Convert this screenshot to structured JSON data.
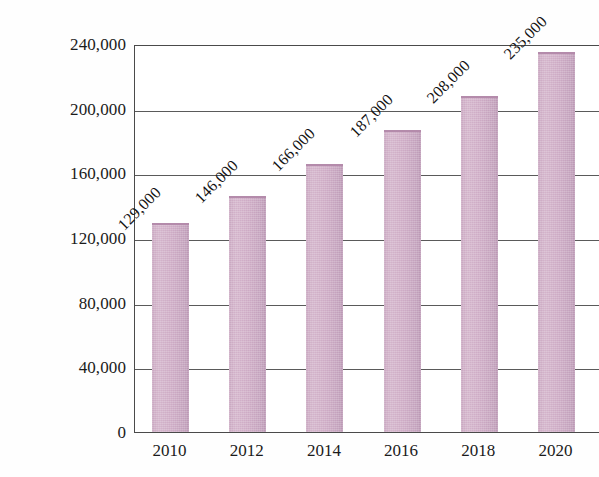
{
  "chart_data": {
    "type": "bar",
    "title": "",
    "xlabel": "",
    "ylabel": "Population",
    "categories": [
      "2010",
      "2012",
      "2014",
      "2016",
      "2018",
      "2020"
    ],
    "values": [
      129000,
      146000,
      166000,
      187000,
      208000,
      235000
    ],
    "data_labels": [
      "129,000",
      "146,000",
      "166,000",
      "187,000",
      "208,000",
      "235,000"
    ],
    "ylim": [
      0,
      240000
    ],
    "ytick_values": [
      0,
      40000,
      80000,
      120000,
      160000,
      200000,
      240000
    ],
    "ytick_labels": [
      "0",
      "40,000",
      "80,000",
      "120,000",
      "160,000",
      "200,000",
      "240,000"
    ],
    "grid": true,
    "legend": null,
    "series_color": "#cdaac4",
    "axis_color": "#4a4a4a",
    "gridline_color": "#5a5a5a",
    "text_color": "#1b1b1b",
    "background": "#ffffff",
    "datalabel_rotation_deg": 45
  }
}
